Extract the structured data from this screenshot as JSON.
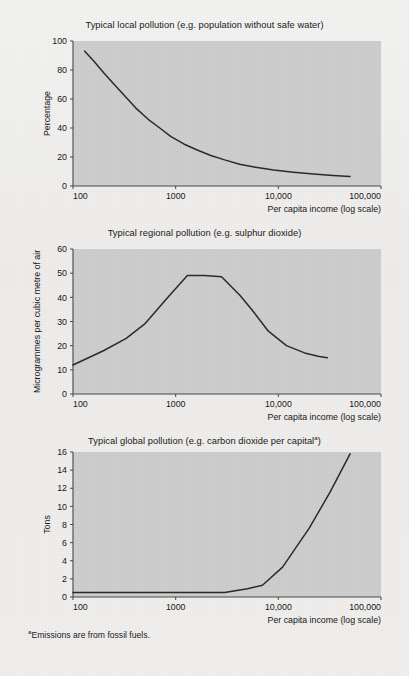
{
  "figure": {
    "background_color": "#f1f0ee",
    "plot_area_color": "#cfcfcf",
    "line_color": "#2b2b2b",
    "axis_color": "#4a4a4a",
    "text_color": "#1a1a1a",
    "footnote": "Emissions are from fossil fuels.",
    "footnote_marker": "a"
  },
  "chart_data": [
    {
      "type": "line",
      "title": "Typical local pollution (e.g. population without safe water)",
      "title_marker": "",
      "xlabel": "Per capita income (log scale)",
      "ylabel": "Percentage",
      "xscale": "log",
      "xlim": [
        100,
        100000
      ],
      "ylim": [
        0,
        100
      ],
      "xticks": [
        100,
        1000,
        10000,
        100000
      ],
      "xticklabels": [
        "100",
        "1000",
        "10,000",
        "100,000"
      ],
      "yticks": [
        0,
        20,
        40,
        60,
        80,
        100
      ],
      "yticklabels": [
        "0",
        "20",
        "40",
        "60",
        "80",
        "100"
      ],
      "grid": false,
      "legend": "none",
      "series": [
        {
          "name": "population without safe water",
          "x": [
            130,
            160,
            200,
            260,
            330,
            420,
            540,
            700,
            900,
            1200,
            1600,
            2200,
            3000,
            4200,
            6000,
            9000,
            14000,
            22000,
            34000,
            50000
          ],
          "y": [
            93,
            86,
            78,
            69,
            61,
            53,
            46,
            40,
            34,
            29,
            25,
            21,
            18,
            15,
            13,
            11,
            9.5,
            8.2,
            7.2,
            6.5
          ]
        }
      ]
    },
    {
      "type": "line",
      "title": "Typical regional pollution (e.g. sulphur dioxide)",
      "title_marker": "",
      "xlabel": "Per capita income (log scale)",
      "ylabel": "Microgrammes per cubic metre of air",
      "xscale": "log",
      "xlim": [
        100,
        100000
      ],
      "ylim": [
        0,
        60
      ],
      "xticks": [
        100,
        1000,
        10000,
        100000
      ],
      "xticklabels": [
        "100",
        "1000",
        "10,000",
        "100,000"
      ],
      "yticks": [
        0,
        10,
        20,
        30,
        40,
        50,
        60
      ],
      "yticklabels": [
        "0",
        "10",
        "20",
        "30",
        "40",
        "50",
        "60"
      ],
      "grid": false,
      "legend": "none",
      "series": [
        {
          "name": "sulphur dioxide",
          "x": [
            100,
            200,
            330,
            500,
            800,
            1300,
            1900,
            2800,
            4200,
            5500,
            8000,
            12000,
            18000,
            25000,
            30000
          ],
          "y": [
            12,
            18,
            23,
            29,
            39,
            49,
            49,
            48.5,
            41,
            35,
            26,
            20,
            17,
            15.5,
            15
          ]
        }
      ]
    },
    {
      "type": "line",
      "title": "Typical global pollution (e.g. carbon dioxide per capital",
      "title_marker": "a",
      "xlabel": "Per capita income (log scale)",
      "ylabel": "Tons",
      "xscale": "log",
      "xlim": [
        100,
        100000
      ],
      "ylim": [
        0,
        16
      ],
      "xticks": [
        100,
        1000,
        10000,
        100000
      ],
      "xticklabels": [
        "100",
        "1000",
        "10,000",
        "100,000"
      ],
      "yticks": [
        0,
        2,
        4,
        6,
        8,
        10,
        12,
        14,
        16
      ],
      "yticklabels": [
        "0",
        "2",
        "4",
        "6",
        "8",
        "10",
        "12",
        "14",
        "16"
      ],
      "grid": false,
      "legend": "none",
      "series": [
        {
          "name": "carbon dioxide per capita",
          "x": [
            100,
            1000,
            3000,
            5000,
            7000,
            11000,
            20000,
            32000,
            50000
          ],
          "y": [
            0.5,
            0.5,
            0.5,
            0.9,
            1.3,
            3.3,
            7.6,
            11.6,
            15.8
          ]
        }
      ]
    }
  ]
}
